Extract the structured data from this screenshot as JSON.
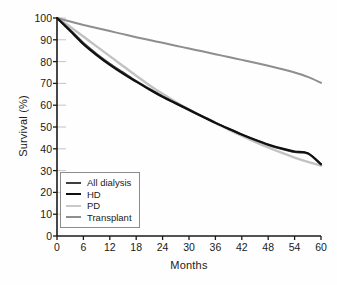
{
  "chart_data": {
    "type": "line",
    "title": "",
    "xlabel": "Months",
    "ylabel": "Survival (%)",
    "xlim": [
      0,
      60
    ],
    "ylim": [
      0,
      100
    ],
    "xticks": [
      0,
      6,
      12,
      18,
      24,
      30,
      36,
      42,
      48,
      54,
      60
    ],
    "yticks": [
      0,
      10,
      20,
      30,
      40,
      50,
      60,
      70,
      80,
      90,
      100
    ],
    "grid": false,
    "legend_position": "lower-left-inside",
    "x": [
      0,
      3,
      6,
      9,
      12,
      15,
      18,
      21,
      24,
      27,
      30,
      33,
      36,
      39,
      42,
      45,
      48,
      51,
      54,
      57,
      60
    ],
    "series": [
      {
        "name": "All dialysis",
        "color": "#3f3f3f",
        "width": 2.1,
        "values": [
          100,
          94.5,
          88.5,
          83.5,
          79.0,
          75.0,
          71.0,
          67.5,
          64.0,
          61.0,
          58.0,
          55.0,
          52.0,
          49.2,
          46.5,
          44.0,
          41.8,
          40.0,
          38.5,
          37.8,
          32.8
        ]
      },
      {
        "name": "HD",
        "color": "#101010",
        "width": 2.1,
        "values": [
          100,
          94.0,
          88.0,
          83.0,
          78.5,
          74.5,
          70.8,
          67.2,
          63.8,
          60.8,
          57.8,
          54.8,
          51.9,
          49.2,
          46.6,
          44.2,
          42.0,
          40.2,
          38.8,
          38.0,
          33.0
        ]
      },
      {
        "name": "PD",
        "color": "#c2c2c2",
        "width": 2.4,
        "values": [
          100,
          96.0,
          91.5,
          87.0,
          82.5,
          78.0,
          73.5,
          69.2,
          65.2,
          61.5,
          58.0,
          54.8,
          51.8,
          48.8,
          46.0,
          43.2,
          40.6,
          38.2,
          36.0,
          34.0,
          32.3
        ]
      },
      {
        "name": "Transplant",
        "color": "#8e8e8e",
        "width": 2.0,
        "values": [
          100,
          98.4,
          96.8,
          95.4,
          94.0,
          92.6,
          91.2,
          89.9,
          88.6,
          87.3,
          86.0,
          84.7,
          83.4,
          82.1,
          80.8,
          79.5,
          78.1,
          76.6,
          75.0,
          73.0,
          70.3
        ]
      }
    ]
  },
  "legend": {
    "entries": [
      {
        "label": "All dialysis",
        "color": "#3f3f3f",
        "width": 2.4
      },
      {
        "label": "HD",
        "color": "#101010",
        "width": 2.6
      },
      {
        "label": "PD",
        "color": "#c9c9c9",
        "width": 2.4
      },
      {
        "label": "Transplant",
        "color": "#8e8e8e",
        "width": 2.4
      }
    ]
  },
  "axes": {
    "color": "#1a1a1a",
    "tick_color": "#bdbdbd"
  }
}
